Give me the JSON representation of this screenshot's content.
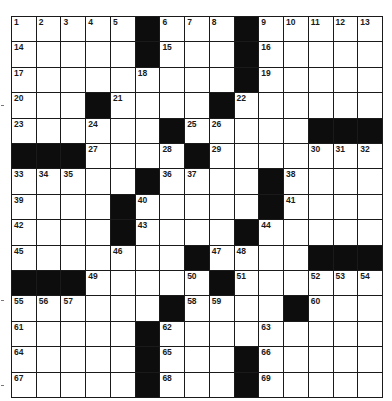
{
  "puzzle": {
    "rows": 15,
    "cols": 15,
    "layout": [
      "1 2 3 4 5 # 6 7 8 # 9 10 11 12 13",
      "14 . . . . # 15 . . # 16 . . . .",
      "17 . . . . 18 . . . # 19 . . . .",
      "20 . . # 21 . . . # 22 . . . . .",
      "23 . . 24 . . # 25 26 . . . # # #",
      "# # # 27 . . 28 # 29 . . . 30 31 32",
      "33 34 35 . . # 36 37 . . # 38 . . .",
      "39 . . . # 40 . . . . # 41 . . .",
      "42 . . . # 43 . . . # 44 . . . .",
      "45 . . . 46 . . # 47 48 . . # # #",
      "# # # 49 . . . 50 # 51 . . 52 53 54",
      "55 56 57 . . . # 58 59 . . # 60 . .",
      "61 . . . . # 62 . . . 63 . . . .",
      "64 . . . . # 65 . . # 66 . . . .",
      "67 . . . . # 68 . . # 69 . . . ."
    ],
    "legend": {
      "#": "black-square",
      ".": "empty-unnumbered-cell",
      "number": "empty-numbered-cell"
    },
    "colors": {
      "black_square": "#0d0d0d",
      "white_square": "#ffffff",
      "grid_line": "#1a1a1a"
    }
  },
  "margin_marks_y": [
    105,
    300,
    385
  ]
}
